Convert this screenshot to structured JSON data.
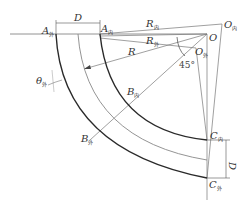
{
  "diagram": {
    "type": "geometric construction",
    "labels": {
      "A_outer": {
        "main": "A",
        "sub": "外"
      },
      "A_inner": {
        "main": "A",
        "sub": "内"
      },
      "D_top": {
        "main": "D"
      },
      "R_inner": {
        "main": "R",
        "sub": "内"
      },
      "R_outer": {
        "main": "R",
        "sub": "外"
      },
      "R": {
        "main": "R"
      },
      "O_inner": {
        "main": "O",
        "sub": "内"
      },
      "O": {
        "main": "O"
      },
      "O_outer": {
        "main": "O",
        "sub": "外"
      },
      "angle": {
        "main": "45°"
      },
      "theta_outer": {
        "main": "θ",
        "sub": "外"
      },
      "B_inner": {
        "main": "B",
        "sub": "内"
      },
      "B_outer": {
        "main": "B",
        "sub": "外"
      },
      "C_inner": {
        "main": "C",
        "sub": "内"
      },
      "C_outer": {
        "main": "C",
        "sub": "外"
      },
      "D_right": {
        "main": "D"
      }
    },
    "colors": {
      "heavy_line": "#2a2a2a",
      "thin_line": "#777777",
      "text": "#333333"
    }
  }
}
